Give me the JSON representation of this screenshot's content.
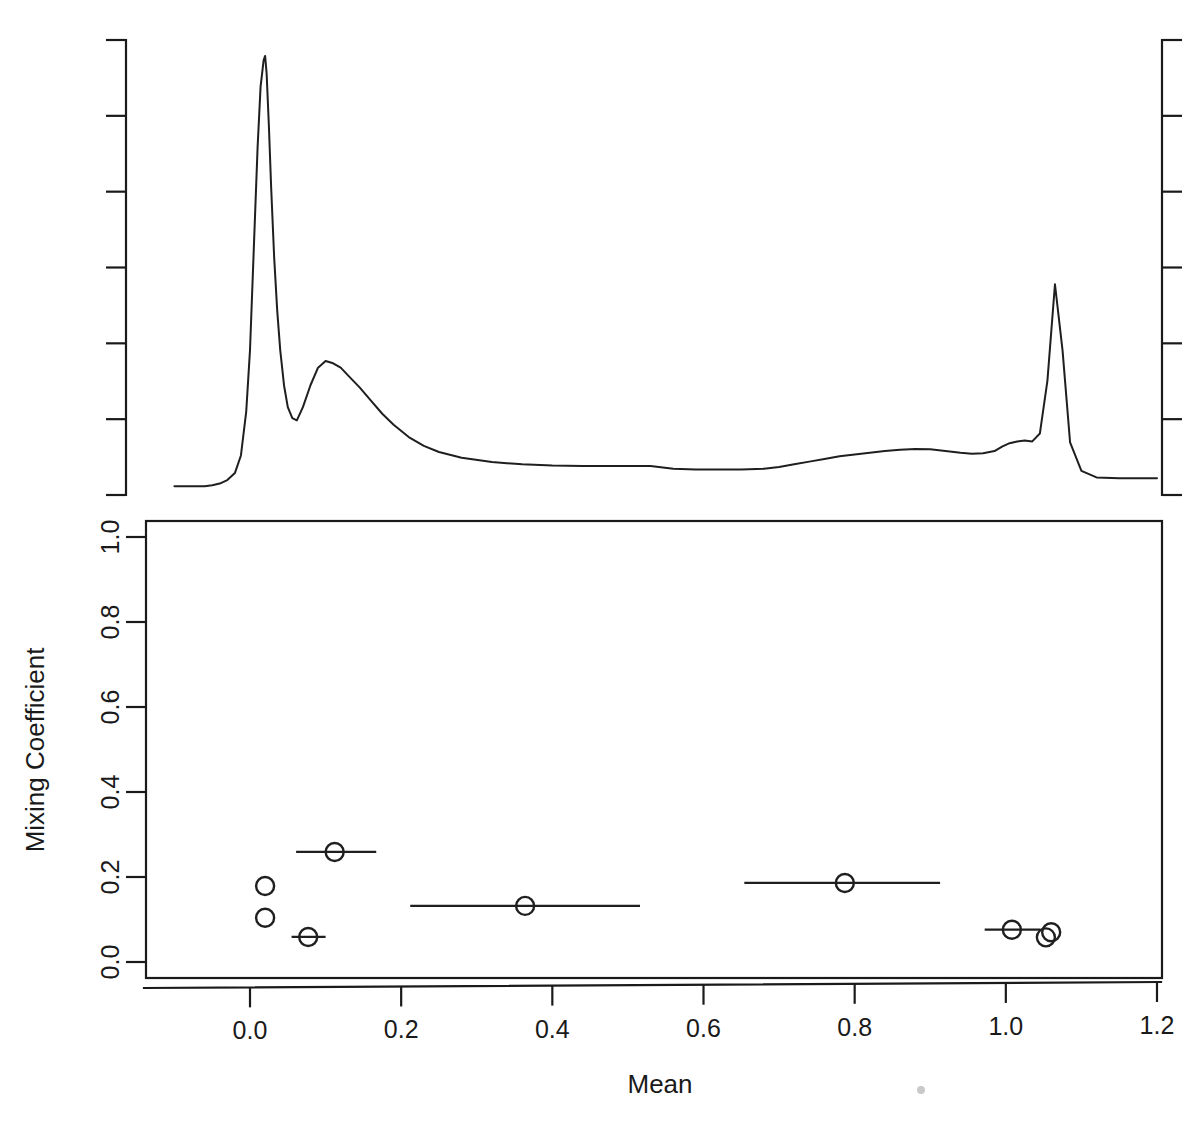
{
  "chart_data": {
    "type": "line",
    "title": "",
    "subtitle": "",
    "panels": [
      {
        "name": "density-panel",
        "type": "line",
        "xlabel": "",
        "ylabel": "",
        "grid": false,
        "legend": "none",
        "xlim": [
          -0.1,
          1.2
        ],
        "ylim": [
          0,
          1
        ],
        "axis_ticks_left_count": 7,
        "axis_ticks_right_count": 7,
        "description": "Kernel density estimate of the data, drawn above the parameter plot with unlabeled tick marks on the left and right spines.",
        "x": [
          -0.1,
          -0.08,
          -0.06,
          -0.05,
          -0.04,
          -0.03,
          -0.02,
          -0.012,
          -0.005,
          0.0,
          0.005,
          0.01,
          0.014,
          0.018,
          0.02,
          0.022,
          0.025,
          0.028,
          0.032,
          0.036,
          0.04,
          0.045,
          0.05,
          0.056,
          0.062,
          0.07,
          0.08,
          0.09,
          0.1,
          0.11,
          0.12,
          0.13,
          0.145,
          0.16,
          0.175,
          0.19,
          0.21,
          0.23,
          0.25,
          0.28,
          0.32,
          0.36,
          0.4,
          0.44,
          0.47,
          0.5,
          0.53,
          0.56,
          0.59,
          0.62,
          0.65,
          0.68,
          0.7,
          0.72,
          0.74,
          0.76,
          0.78,
          0.8,
          0.82,
          0.84,
          0.86,
          0.88,
          0.9,
          0.92,
          0.94,
          0.955,
          0.97,
          0.985,
          0.995,
          1.005,
          1.015,
          1.025,
          1.035,
          1.045,
          1.055,
          1.065,
          1.075,
          1.085,
          1.1,
          1.12,
          1.15,
          1.18,
          1.2
        ],
        "y": [
          0.02,
          0.02,
          0.02,
          0.022,
          0.026,
          0.034,
          0.05,
          0.09,
          0.19,
          0.33,
          0.56,
          0.79,
          0.93,
          0.99,
          1.0,
          0.96,
          0.84,
          0.7,
          0.54,
          0.42,
          0.33,
          0.25,
          0.2,
          0.175,
          0.17,
          0.2,
          0.25,
          0.29,
          0.305,
          0.3,
          0.29,
          0.272,
          0.245,
          0.215,
          0.185,
          0.16,
          0.132,
          0.112,
          0.098,
          0.085,
          0.075,
          0.07,
          0.067,
          0.066,
          0.066,
          0.066,
          0.066,
          0.06,
          0.058,
          0.058,
          0.058,
          0.06,
          0.064,
          0.07,
          0.076,
          0.082,
          0.088,
          0.092,
          0.096,
          0.1,
          0.103,
          0.105,
          0.104,
          0.1,
          0.096,
          0.094,
          0.095,
          0.1,
          0.11,
          0.118,
          0.122,
          0.124,
          0.122,
          0.14,
          0.26,
          0.48,
          0.33,
          0.12,
          0.055,
          0.04,
          0.038,
          0.038,
          0.038
        ],
        "peaks": [
          {
            "mean": 0.02,
            "height": 1.0,
            "label": "primary mode"
          },
          {
            "mean": 0.1,
            "height": 0.305,
            "label": "secondary mode"
          },
          {
            "mean": 1.055,
            "height": 0.48,
            "label": "right mode"
          }
        ]
      },
      {
        "name": "mixture-parameter-panel",
        "type": "scatter",
        "xlabel": "Mean",
        "ylabel": "Mixing Coefficient",
        "grid": false,
        "legend": "none",
        "xlim": [
          -0.1,
          1.2
        ],
        "ylim": [
          0.0,
          1.05
        ],
        "xticks": [
          0.0,
          0.2,
          0.4,
          0.6,
          0.8,
          1.0,
          1.2
        ],
        "xticklabels": [
          "0.0",
          "0.2",
          "0.4",
          "0.6",
          "0.8",
          "1.0",
          "1.2"
        ],
        "yticks": [
          0.0,
          0.2,
          0.4,
          0.6,
          0.8,
          1.0
        ],
        "yticklabels": [
          "0.0",
          "0.2",
          "0.4",
          "0.6",
          "0.8",
          "1.0"
        ],
        "marker": "open-circle",
        "points": [
          {
            "mean": 0.02,
            "mixing_coefficient": 0.179,
            "xmin": 0.02,
            "xmax": 0.02
          },
          {
            "mean": 0.02,
            "mixing_coefficient": 0.104,
            "xmin": 0.02,
            "xmax": 0.02
          },
          {
            "mean": 0.077,
            "mixing_coefficient": 0.059,
            "xmin": 0.055,
            "xmax": 0.1
          },
          {
            "mean": 0.112,
            "mixing_coefficient": 0.259,
            "xmin": 0.061,
            "xmax": 0.167
          },
          {
            "mean": 0.364,
            "mixing_coefficient": 0.132,
            "xmin": 0.212,
            "xmax": 0.516
          },
          {
            "mean": 0.787,
            "mixing_coefficient": 0.186,
            "xmin": 0.654,
            "xmax": 0.913
          },
          {
            "mean": 1.008,
            "mixing_coefficient": 0.076,
            "xmin": 0.972,
            "xmax": 1.046
          },
          {
            "mean": 1.06,
            "mixing_coefficient": 0.07,
            "xmin": 1.06,
            "xmax": 1.06
          },
          {
            "mean": 1.053,
            "mixing_coefficient": 0.058,
            "xmin": 1.053,
            "xmax": 1.053
          }
        ]
      }
    ]
  },
  "labels": {
    "x_axis_title": "Mean",
    "y_axis_title": "Mixing Coefficient"
  }
}
